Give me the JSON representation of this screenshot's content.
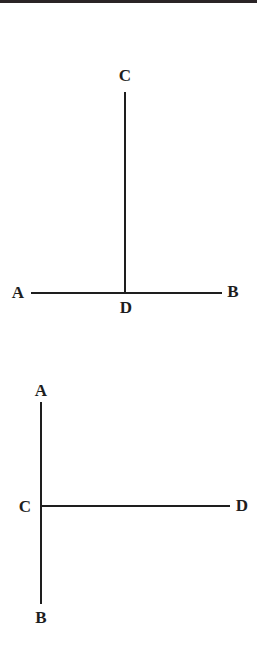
{
  "figures": [
    {
      "description": "Perpendicular CD meeting line AB at D",
      "labels": {
        "top": "C",
        "left": "A",
        "right": "B",
        "foot": "D"
      }
    },
    {
      "description": "Line CD perpendicular to vertical line AB at C",
      "labels": {
        "top": "A",
        "middle": "C",
        "right": "D",
        "bottom": "B"
      }
    }
  ],
  "colors": {
    "ink": "#1e1e1e",
    "background": "#ffffff",
    "top_bar": "#2a2426"
  }
}
